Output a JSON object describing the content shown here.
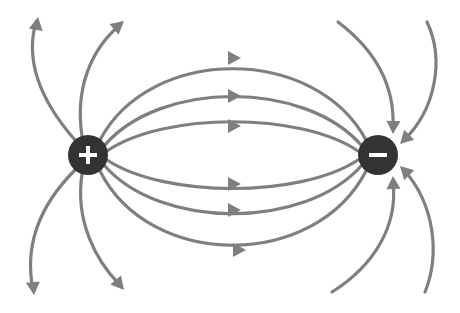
{
  "diagram": {
    "colors": {
      "background": "#ffffff",
      "field_line": "#7f7f7f",
      "charge_fill": "#333333",
      "charge_symbol": "#ffffff"
    },
    "charges": [
      {
        "id": "positive",
        "sign": "+",
        "label": "Positive charge",
        "cx": 88,
        "cy": 155,
        "r": 20
      },
      {
        "id": "negative",
        "sign": "−",
        "label": "Negative charge",
        "cx": 378,
        "cy": 155,
        "r": 20
      }
    ],
    "connecting_field_lines": [
      {
        "id": "top-1",
        "path": "M 100 140 C 150 45, 315 45, 366 140",
        "arrow_at": [
          235,
          58
        ],
        "direction": "right"
      },
      {
        "id": "top-2",
        "path": "M 104 146 C 160 80, 305 80, 362 146",
        "arrow_at": [
          235,
          96
        ],
        "direction": "right"
      },
      {
        "id": "top-3",
        "path": "M 107 151 C 165 112, 300 112, 358 151",
        "arrow_at": [
          235,
          126
        ],
        "direction": "right"
      },
      {
        "id": "bottom-1",
        "path": "M 107 160 C 165 198, 300 198, 358 160",
        "arrow_at": [
          235,
          184
        ],
        "direction": "right"
      },
      {
        "id": "bottom-2",
        "path": "M 104 165 C 160 230, 305 230, 362 165",
        "arrow_at": [
          235,
          210
        ],
        "direction": "right"
      },
      {
        "id": "bottom-3",
        "path": "M 100 171 C 150 270, 315 270, 366 171",
        "arrow_at": [
          240,
          250
        ],
        "direction": "right"
      }
    ],
    "outgoing_field_lines": [
      {
        "id": "out-top-left",
        "path": "M 75 140 C 40 100, 25 60, 36 22",
        "tip": [
          38,
          17
        ],
        "angle": -80
      },
      {
        "id": "out-top-mid",
        "path": "M 82 136 C 75 90, 90 50, 120 25",
        "tip": [
          124,
          21
        ],
        "angle": -40
      },
      {
        "id": "out-bottom-left",
        "path": "M 75 170 C 35 210, 25 250, 33 290",
        "tip": [
          34,
          295
        ],
        "angle": 85
      },
      {
        "id": "out-bottom-mid",
        "path": "M 82 174 C 75 220, 95 260, 120 285",
        "tip": [
          124,
          290
        ],
        "angle": 50
      }
    ],
    "incoming_field_lines": [
      {
        "id": "in-top-mid",
        "path": "M 338 22 C 375 50, 395 85, 393 128",
        "tip": [
          393,
          134
        ],
        "angle": 92
      },
      {
        "id": "in-top-right",
        "path": "M 427 22 C 445 60, 435 110, 404 140",
        "tip": [
          400,
          144
        ],
        "angle": 135
      },
      {
        "id": "in-bottom-mid",
        "path": "M 332 292 C 375 265, 398 225, 393 182",
        "tip": [
          393,
          176
        ],
        "angle": -92
      },
      {
        "id": "in-bottom-right",
        "path": "M 425 292 C 440 255, 435 205, 404 170",
        "tip": [
          400,
          166
        ],
        "angle": -135
      }
    ]
  }
}
